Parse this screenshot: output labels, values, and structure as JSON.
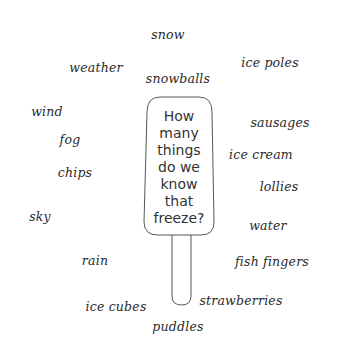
{
  "question": {
    "lines": [
      "How",
      "many",
      "things",
      "do we",
      "know that",
      "freeze?"
    ]
  },
  "words": [
    {
      "text": "snow",
      "x": 168,
      "y": 34
    },
    {
      "text": "weather",
      "x": 96,
      "y": 67
    },
    {
      "text": "ice poles",
      "x": 270,
      "y": 62
    },
    {
      "text": "snowballs",
      "x": 178,
      "y": 78
    },
    {
      "text": "wind",
      "x": 47,
      "y": 111
    },
    {
      "text": "sausages",
      "x": 280,
      "y": 122
    },
    {
      "text": "fog",
      "x": 70,
      "y": 139
    },
    {
      "text": "ice cream",
      "x": 261,
      "y": 154
    },
    {
      "text": "chips",
      "x": 75,
      "y": 172
    },
    {
      "text": "lollies",
      "x": 279,
      "y": 186
    },
    {
      "text": "sky",
      "x": 40,
      "y": 216
    },
    {
      "text": "water",
      "x": 268,
      "y": 225
    },
    {
      "text": "rain",
      "x": 95,
      "y": 260
    },
    {
      "text": "fish fingers",
      "x": 272,
      "y": 261
    },
    {
      "text": "strawberries",
      "x": 241,
      "y": 300
    },
    {
      "text": "ice cubes",
      "x": 116,
      "y": 306
    },
    {
      "text": "puddles",
      "x": 178,
      "y": 326
    }
  ],
  "colors": {
    "outline": "#555555",
    "text": "#2a2a2a",
    "background": "#ffffff"
  }
}
